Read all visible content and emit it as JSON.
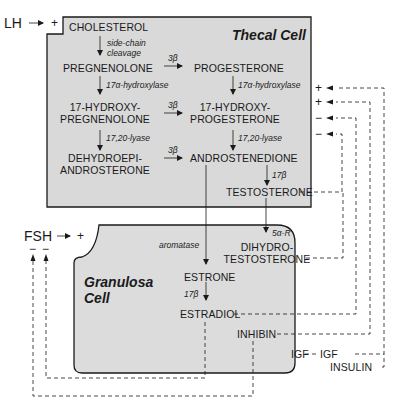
{
  "thecal_cell": {
    "title": "Thecal Cell",
    "background": "#d9d9d9",
    "metabolites": {
      "cholesterol": "CHOLESTEROL",
      "pregnenolone": "PREGNENOLONE",
      "hydroxy_pregnenolone_1": "17-HYDROXY-",
      "hydroxy_pregnenolone_2": "PREGNENOLONE",
      "dhea_1": "DEHYDROEPI-",
      "dhea_2": "ANDROSTERONE",
      "progesterone": "PROGESTERONE",
      "hydroxy_progesterone_1": "17-HYDROXY-",
      "hydroxy_progesterone_2": "PROGESTERONE",
      "androstenedione": "ANDROSTENEDIONE",
      "testosterone": "TESTOSTERONE"
    },
    "enzymes": {
      "side_chain_1": "side-chain",
      "side_chain_2": "cleavage",
      "hydroxylase_left": "17α-hydroxylase",
      "lyase_left": "17,20-lyase",
      "hsd_1": "3β",
      "hsd_2": "3β",
      "hsd_3": "3β",
      "hydroxylase_right": "17α-hydroxylase",
      "lyase_right": "17,20-lyase",
      "hsd17_thecal": "17β"
    }
  },
  "granulosa_cell": {
    "title_1": "Granulosa",
    "title_2": "Cell",
    "background": "#dcdcdc",
    "metabolites": {
      "dht_1": "DIHYDRO-",
      "dht_2": "TESTOSTERONE",
      "estrone": "ESTRONE",
      "estradiol": "ESTRADIOL",
      "inhibin": "INHIBIN",
      "igf": "IGF"
    },
    "enzymes": {
      "aromatase": "aromatase",
      "five_alpha_r": "5α-R",
      "hsd17_granulosa": "17β"
    }
  },
  "external": {
    "lh": "LH",
    "lh_sign": "+",
    "fsh": "FSH",
    "fsh_sign": "+",
    "fsh_feedback_signs": [
      "−",
      "−"
    ],
    "igf": "IGF",
    "insulin": "INSULIN",
    "lh_feedback_signs": [
      "+",
      "+",
      "−",
      "−"
    ]
  }
}
